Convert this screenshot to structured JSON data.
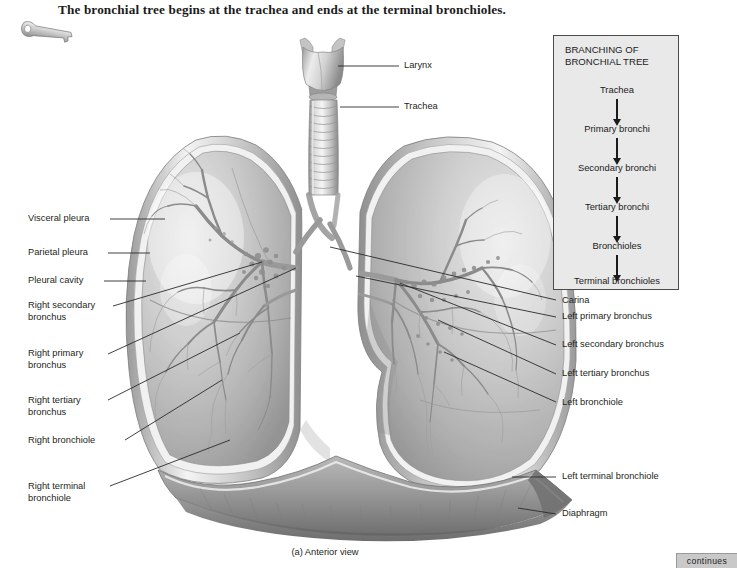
{
  "figure": {
    "title": "The bronchial tree begins at the trachea and ends at the terminal bronchioles.",
    "caption": "(a) Anterior view",
    "continues_tab": "continues",
    "key_icon_name": "key-icon"
  },
  "flowchart": {
    "heading": "BRANCHING OF\nBRONCHIAL TREE",
    "steps": [
      "Trachea",
      "Primary bronchi",
      "Secondary bronchi",
      "Tertiary bronchi",
      "Bronchioles",
      "Terminal bronchioles"
    ],
    "background_color": "#e9e9e9",
    "border_color": "#4a4a4a"
  },
  "labels": {
    "top": [
      {
        "text": "Larynx",
        "x": 404,
        "y": 62
      },
      {
        "text": "Trachea",
        "x": 404,
        "y": 103
      }
    ],
    "left": [
      {
        "text": "Visceral pleura",
        "x": 28,
        "y": 214
      },
      {
        "text": "Parietal pleura",
        "x": 28,
        "y": 248
      },
      {
        "text": "Pleural cavity",
        "x": 28,
        "y": 276
      },
      {
        "text": "Right secondary\nbronchus",
        "x": 28,
        "y": 306
      },
      {
        "text": "Right primary\nbronchus",
        "x": 28,
        "y": 354
      },
      {
        "text": "Right tertiary\nbronchus",
        "x": 28,
        "y": 401
      },
      {
        "text": "Right bronchiole",
        "x": 28,
        "y": 440
      },
      {
        "text": "Right terminal\nbronchiole",
        "x": 28,
        "y": 486
      }
    ],
    "right": [
      {
        "text": "Carina",
        "x": 566,
        "y": 301
      },
      {
        "text": "Left primary bronchus",
        "x": 566,
        "y": 317
      },
      {
        "text": "Left secondary bronchus",
        "x": 566,
        "y": 345
      },
      {
        "text": "Left tertiary bronchus",
        "x": 566,
        "y": 374
      },
      {
        "text": "Left bronchiole",
        "x": 566,
        "y": 403
      },
      {
        "text": "Left terminal bronchiole",
        "x": 566,
        "y": 477
      },
      {
        "text": "Diaphragm",
        "x": 566,
        "y": 514
      }
    ]
  },
  "colors": {
    "page_background": "#ffffff",
    "text": "#231f20",
    "leader_line": "#2a2a2a",
    "lung_light": "#d8d8d8",
    "lung_mid": "#b4b4b4",
    "lung_dark": "#8d8d8d",
    "tab_gray": "#c9c9c9"
  }
}
